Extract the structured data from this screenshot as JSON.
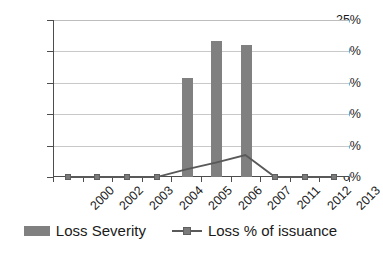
{
  "chart_data": {
    "type": "bar",
    "title": "",
    "xlabel": "",
    "ylabel": "",
    "ylim": [
      0,
      25
    ],
    "ytick_labels": [
      "0%",
      "5%",
      "10%",
      "15%",
      "20%",
      "25%"
    ],
    "ytick_values": [
      0,
      5,
      10,
      15,
      20,
      25
    ],
    "grid": true,
    "legend_position": "bottom",
    "categories": [
      "2000",
      "2002",
      "2003",
      "2004",
      "2005",
      "2006",
      "2007",
      "2011",
      "2012",
      "2013"
    ],
    "series": [
      {
        "name": "Loss Severity",
        "type": "bar",
        "color": "#808080",
        "values": [
          0,
          0,
          0,
          0,
          15.8,
          21.7,
          21.0,
          0,
          0,
          0
        ]
      },
      {
        "name": "Loss % of issuance",
        "type": "line",
        "color": "#595959",
        "marker": "square",
        "values": [
          0,
          0,
          0,
          0,
          1.2,
          2.3,
          3.5,
          0,
          0,
          0
        ]
      }
    ]
  },
  "legend": {
    "items": [
      {
        "label": "Loss Severity",
        "swatch": "bar-swatch",
        "color": "#808080"
      },
      {
        "label": "Loss % of issuance",
        "swatch": "line-marker-swatch",
        "color": "#595959"
      }
    ]
  }
}
